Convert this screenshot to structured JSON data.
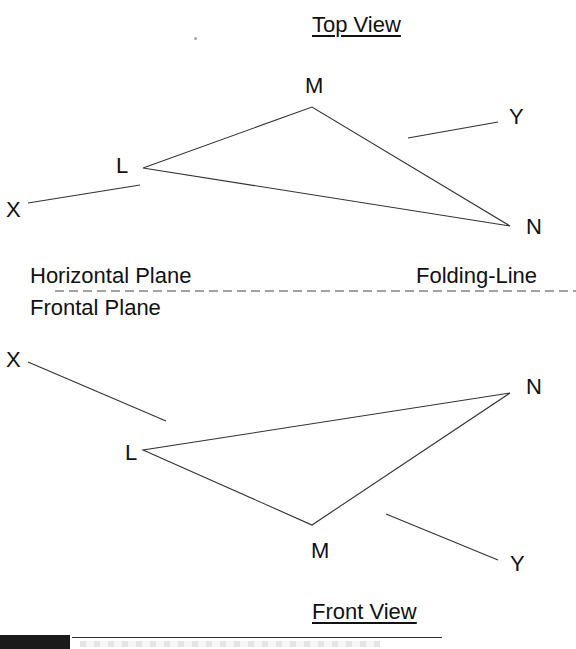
{
  "diagram": {
    "top_view": {
      "title": "Top View",
      "points": {
        "L": {
          "label": "L",
          "x": 143,
          "y": 168
        },
        "M": {
          "label": "M",
          "x": 312,
          "y": 107
        },
        "N": {
          "label": "N",
          "x": 510,
          "y": 226
        }
      },
      "line_x": {
        "label": "X",
        "x1": 28,
        "y1": 203,
        "x2": 140,
        "y2": 185
      },
      "line_y": {
        "label": "Y",
        "x1": 408,
        "y1": 138,
        "x2": 498,
        "y2": 122
      }
    },
    "folding_line": {
      "label": "Folding-Line",
      "upper_plane": "Horizontal Plane",
      "lower_plane": "Frontal Plane",
      "y": 291,
      "x1": 55,
      "x2": 576
    },
    "front_view": {
      "title": "Front View",
      "points": {
        "L": {
          "label": "L",
          "x": 143,
          "y": 450
        },
        "M": {
          "label": "M",
          "x": 312,
          "y": 525
        },
        "N": {
          "label": "N",
          "x": 510,
          "y": 393
        }
      },
      "line_x": {
        "label": "X",
        "x1": 28,
        "y1": 362,
        "x2": 166,
        "y2": 421
      },
      "line_y": {
        "label": "Y",
        "x1": 386,
        "y1": 514,
        "x2": 498,
        "y2": 560
      }
    },
    "colors": {
      "stroke": "#333333",
      "text": "#111111",
      "background": "#ffffff"
    }
  }
}
